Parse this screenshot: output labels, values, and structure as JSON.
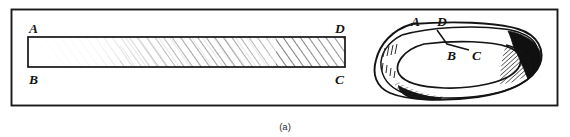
{
  "figure": {
    "caption": "(a)",
    "frame": {
      "stroke_color": "#1a1a1a"
    },
    "background_color": "#ffffff",
    "ink_color": "#141414"
  },
  "flat_strip": {
    "name": "flat-rectangular-strip",
    "labels": {
      "top_left": "A",
      "bottom_left": "B",
      "top_right": "D",
      "bottom_right": "C"
    },
    "hatch_color": "#3d3d3d"
  },
  "mobius_band": {
    "name": "twisted-mobius-band",
    "labels": {
      "top_left": "A",
      "top_right": "D",
      "inner_left": "B",
      "inner_right": "C"
    },
    "shade_color": "#101010"
  }
}
